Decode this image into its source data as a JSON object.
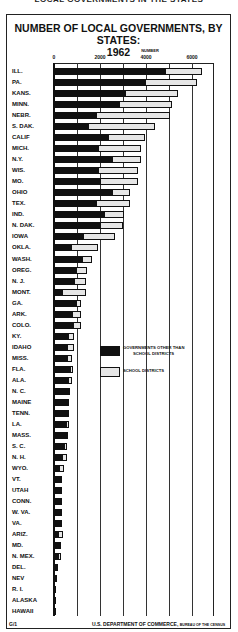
{
  "page": {
    "top_caption": "LOCAL GOVERNMENTS IN THE STATES",
    "footer_left": "G/1",
    "footer_right_main": "U.S. DEPARTMENT OF COMMERCE,",
    "footer_right_small": "BUREAU OF THE CENSUS"
  },
  "legend": {
    "other": "GOVERNMENTS OTHER THAN SCHOOL DISTRICTS",
    "other_line1": "GOVERNMENTS OTHER THAN",
    "other_line2": "SCHOOL DISTRICTS",
    "school": "SCHOOL DISTRICTS"
  },
  "chart_data": {
    "type": "bar",
    "orientation": "horizontal",
    "stacked": true,
    "title": "NUMBER OF LOCAL GOVERNMENTS, BY STATES: 1962",
    "title_line1": "NUMBER OF LOCAL GOVERNMENTS, BY STATES:",
    "title_line2": "1962",
    "xlabel": "NUMBER",
    "ylabel": "",
    "xlim": [
      0,
      7000
    ],
    "xticks": [
      0,
      2000,
      4000,
      6000
    ],
    "xtick_labels": [
      "0",
      "2000",
      "4000",
      "6000"
    ],
    "grid": true,
    "grid_interval": 1000,
    "legend_position": "inside-center",
    "categories": [
      "ILL.",
      "PA.",
      "KANS.",
      "MINN.",
      "NEBR.",
      "S. DAK.",
      "CALIF",
      "MICH.",
      "N.Y.",
      "WIS.",
      "MO.",
      "OHIO",
      "TEX.",
      "IND.",
      "N. DAK.",
      "IOWA",
      "OKLA.",
      "WASH.",
      "OREG.",
      "N. J.",
      "MONT.",
      "GA.",
      "ARK.",
      "COLO.",
      "KY.",
      "IDAHO",
      "MISS.",
      "FLA.",
      "ALA.",
      "N. C.",
      "MAINE",
      "TENN.",
      "LA.",
      "MASS.",
      "S. C.",
      "N. H.",
      "WYO.",
      "VT.",
      "UTAH",
      "CONN.",
      "W. VA.",
      "VA.",
      "ARIZ.",
      "MD.",
      "N. MEX.",
      "DEL.",
      "NEV",
      "R. I.",
      "ALASKA",
      "HAWAII"
    ],
    "series": [
      {
        "name": "GOVERNMENTS OTHER THAN SCHOOL DISTRICTS",
        "color": "#111111",
        "values": [
          4870,
          4000,
          3130,
          2870,
          1870,
          1520,
          2400,
          1960,
          2570,
          1960,
          2040,
          2570,
          1870,
          2220,
          2040,
          1300,
          780,
          1260,
          1000,
          910,
          390,
          1000,
          830,
          870,
          650,
          610,
          610,
          740,
          650,
          700,
          650,
          650,
          570,
          610,
          480,
          390,
          260,
          350,
          350,
          350,
          350,
          350,
          220,
          300,
          220,
          130,
          130,
          90,
          40,
          20
        ]
      },
      {
        "name": "SCHOOL DISTRICTS",
        "color": "#e6e6e6",
        "pattern": "dotted",
        "values": [
          1580,
          2200,
          2270,
          2260,
          3180,
          2880,
          1560,
          1840,
          1230,
          1690,
          1610,
          730,
          1430,
          830,
          960,
          1350,
          1130,
          390,
          430,
          480,
          1000,
          170,
          340,
          300,
          220,
          260,
          170,
          40,
          130,
          0,
          0,
          0,
          80,
          0,
          90,
          180,
          170,
          0,
          0,
          0,
          0,
          0,
          170,
          0,
          40,
          40,
          0,
          0,
          0,
          0
        ]
      }
    ]
  }
}
